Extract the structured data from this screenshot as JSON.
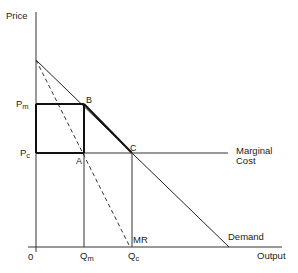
{
  "diagram": {
    "type": "economics-monopoly-vs-competition",
    "axes": {
      "y_label": "Price",
      "x_label": "Output",
      "origin_label": "0"
    },
    "price_levels": {
      "pm": {
        "base": "P",
        "sub": "m"
      },
      "pc": {
        "base": "P",
        "sub": "c"
      }
    },
    "quantity_levels": {
      "qm": {
        "base": "Q",
        "sub": "m"
      },
      "qc": {
        "base": "Q",
        "sub": "c"
      }
    },
    "points": {
      "a": "A",
      "b": "B",
      "c": "C"
    },
    "curves": {
      "demand": "Demand",
      "mr": "MR",
      "mc_line1": "Marginal",
      "mc_line2": "Cost"
    },
    "colors": {
      "line": "#333333",
      "bold": "#111111",
      "text": "#222222"
    }
  }
}
